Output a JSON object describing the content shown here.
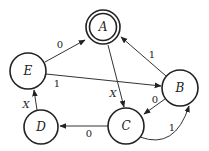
{
  "diagram": {
    "type": "state-machine",
    "states": [
      {
        "id": "A",
        "label": "A",
        "accepting": true
      },
      {
        "id": "B",
        "label": "B",
        "accepting": false
      },
      {
        "id": "C",
        "label": "C",
        "accepting": false
      },
      {
        "id": "D",
        "label": "D",
        "accepting": false
      },
      {
        "id": "E",
        "label": "E",
        "accepting": false
      }
    ],
    "transitions": [
      {
        "from": "E",
        "to": "A",
        "label": "0"
      },
      {
        "from": "E",
        "to": "B",
        "label": "1"
      },
      {
        "from": "B",
        "to": "A",
        "label": "1"
      },
      {
        "from": "A",
        "to": "C",
        "label": "X"
      },
      {
        "from": "B",
        "to": "C",
        "label": "0"
      },
      {
        "from": "C",
        "to": "B",
        "label": "1"
      },
      {
        "from": "C",
        "to": "D",
        "label": "0"
      },
      {
        "from": "D",
        "to": "E",
        "label": "X"
      }
    ]
  }
}
